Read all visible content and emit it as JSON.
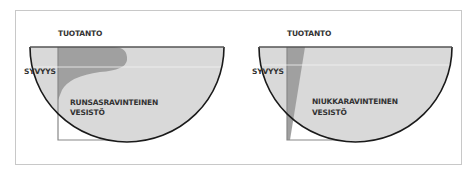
{
  "panels": [
    {
      "id": "eutrophic",
      "production_label": "TUOTANTO",
      "depth_label": "SYVYYS",
      "title_line1": "RUNSASRAVINTEINEN",
      "title_line2": "VESISTÖ"
    },
    {
      "id": "oligotrophic",
      "production_label": "TUOTANTO",
      "depth_label": "SYVYYS",
      "title_line1": "NIUKKARAVINTEINEN",
      "title_line2": "VESISTÖ"
    }
  ],
  "colors": {
    "water": "#d9d9d9",
    "production": "#9e9e9e",
    "outline": "#1a1a1a",
    "axis": "#888888",
    "surface_line": "#f2f2f2"
  }
}
